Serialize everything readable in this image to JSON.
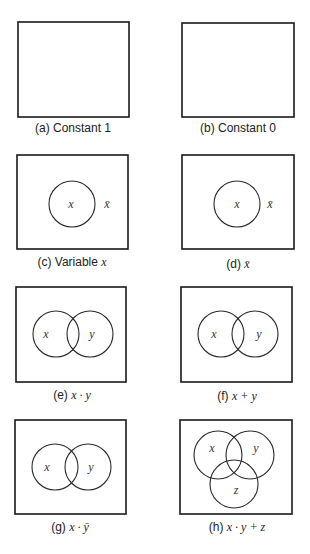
{
  "figure": {
    "panels": [
      {
        "id": "a",
        "prefix": "(a)",
        "caption_text": "Constant 1",
        "caption_math": "",
        "region_labels": []
      },
      {
        "id": "b",
        "prefix": "(b)",
        "caption_text": "Constant 0",
        "caption_math": "",
        "region_labels": []
      },
      {
        "id": "c",
        "prefix": "(c)",
        "caption_text": "Variable",
        "caption_math": "x",
        "region_labels": [
          "x",
          "x̄"
        ]
      },
      {
        "id": "d",
        "prefix": "(d)",
        "caption_text": "",
        "caption_math": "x̄",
        "region_labels": [
          "x",
          "x̄"
        ]
      },
      {
        "id": "e",
        "prefix": "(e)",
        "caption_text": "",
        "caption_math": "x · y",
        "region_labels": [
          "x",
          "y"
        ]
      },
      {
        "id": "f",
        "prefix": "(f)",
        "caption_text": "",
        "caption_math": "x + y",
        "region_labels": [
          "x",
          "y"
        ]
      },
      {
        "id": "g",
        "prefix": "(g)",
        "caption_text": "",
        "caption_math": "x · ȳ",
        "region_labels": [
          "x",
          "y"
        ]
      },
      {
        "id": "h",
        "prefix": "(h)",
        "caption_text": "",
        "caption_math": "x · y + z",
        "region_labels": [
          "x",
          "y",
          "z"
        ]
      }
    ]
  }
}
